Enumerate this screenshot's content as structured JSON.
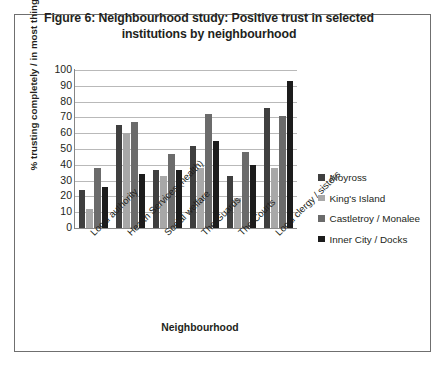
{
  "figure": {
    "title_line1": "Figure 6: Neighbourhood study: Positive trust in selected",
    "title_line2": "institutions by neighbourhood"
  },
  "chart_data": {
    "type": "bar",
    "title": "Figure 6: Neighbourhood study: Positive trust in selected institutions by neighbourhood",
    "xlabel": "Neighbourhood",
    "ylabel": "% trusting completely / in most things",
    "ylim": [
      0,
      100
    ],
    "ytick_step": 10,
    "yticks": [
      "100",
      "90",
      "80",
      "70",
      "60",
      "50",
      "40",
      "30",
      "20",
      "10",
      "0"
    ],
    "grid": true,
    "legend_position": "right",
    "categories": [
      "Local authority",
      "Health Services (health)",
      "Social welfare",
      "The Guards",
      "The Courts",
      "Local clergy / sisters"
    ],
    "series": [
      {
        "name": "Moyross",
        "color": "#3f3f3f",
        "values": [
          24,
          65,
          37,
          52,
          33,
          76
        ]
      },
      {
        "name": "King's Island",
        "color": "#a8a8a8",
        "values": [
          12,
          60,
          33,
          38,
          19,
          38
        ]
      },
      {
        "name": "Castletroy / Monalee",
        "color": "#6b6b6b",
        "values": [
          38,
          67,
          47,
          72,
          48,
          71
        ]
      },
      {
        "name": "Inner City / Docks",
        "color": "#1c1c1c",
        "values": [
          26,
          34,
          37,
          55,
          40,
          93
        ]
      }
    ]
  }
}
